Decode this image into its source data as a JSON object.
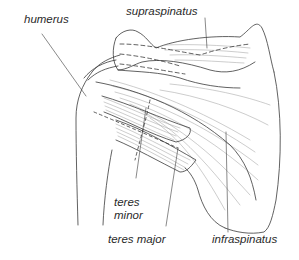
{
  "diagram": {
    "labels": {
      "humerus": "humerus",
      "supraspinatus": "supraspinatus",
      "teres_minor_line1": "teres",
      "teres_minor_line2": "minor",
      "teres_major": "teres major",
      "infraspinatus": "infraspinatus"
    },
    "colors": {
      "line": "#3a3a3a",
      "hatch": "#9a9a9a",
      "background": "#ffffff"
    }
  }
}
